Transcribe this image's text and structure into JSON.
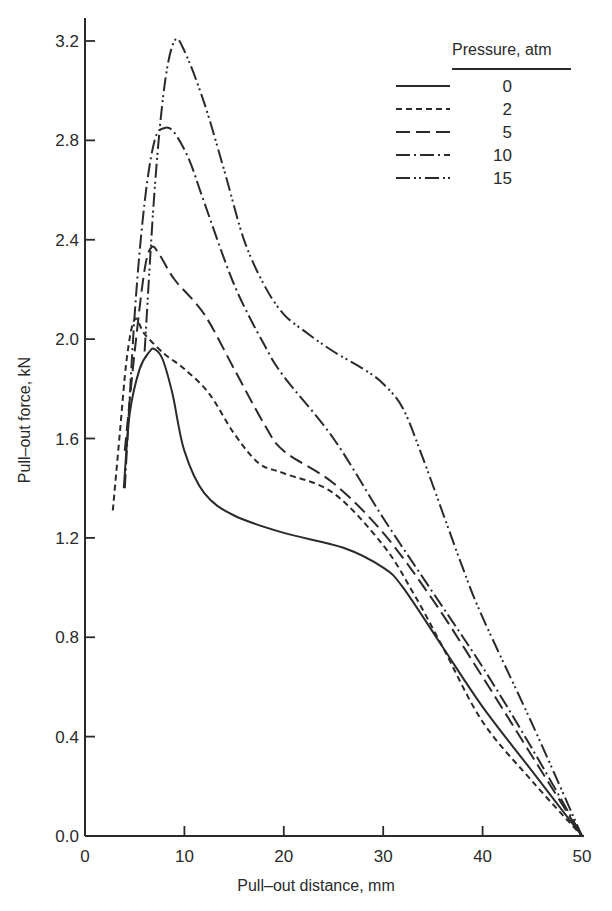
{
  "chart_data": {
    "type": "line",
    "title": "",
    "xlabel": "Pull–out distance, mm",
    "ylabel": "Pull–out force, kN",
    "xlim": [
      0,
      50
    ],
    "ylim": [
      0,
      3.2
    ],
    "x_ticks": [
      0,
      10,
      20,
      30,
      40,
      50
    ],
    "x_tick_labels": [
      "0",
      "10",
      "20",
      "30",
      "40",
      "50"
    ],
    "y_ticks": [
      0.0,
      0.4,
      0.8,
      1.2,
      1.6,
      2.0,
      2.4,
      2.8,
      3.2
    ],
    "y_tick_labels": [
      "0.0",
      "0.4",
      "0.8",
      "1.2",
      "1.6",
      "2.0",
      "2.4",
      "2.8",
      "3.2"
    ],
    "grid": false,
    "legend": {
      "title": "Pressure, atm",
      "position": "upper right"
    },
    "series": [
      {
        "name": "0",
        "line_style": "solid",
        "x": [
          3.9,
          4.5,
          5.5,
          6.5,
          7.0,
          7.8,
          8.8,
          10,
          12,
          15,
          20,
          26,
          30,
          32,
          36,
          40,
          45,
          50
        ],
        "y": [
          1.4,
          1.7,
          1.88,
          1.95,
          1.96,
          1.92,
          1.78,
          1.55,
          1.38,
          1.29,
          1.22,
          1.16,
          1.08,
          1.0,
          0.76,
          0.52,
          0.26,
          0.0
        ]
      },
      {
        "name": "2",
        "line_style": "dashed",
        "x": [
          2.8,
          3.5,
          4.2,
          5.0,
          6.0,
          8.0,
          10,
          12.5,
          15,
          17.5,
          20,
          25,
          30,
          33,
          36,
          40,
          45,
          50
        ],
        "y": [
          1.31,
          1.62,
          1.92,
          2.08,
          2.02,
          1.94,
          1.88,
          1.78,
          1.62,
          1.5,
          1.46,
          1.38,
          1.17,
          0.98,
          0.76,
          0.46,
          0.22,
          0.0
        ]
      },
      {
        "name": "5",
        "line_style": "long-dash",
        "x": [
          4.0,
          5.0,
          6.0,
          6.7,
          7.5,
          9.0,
          12,
          15,
          18,
          20,
          25,
          30,
          35,
          40,
          45,
          50
        ],
        "y": [
          1.55,
          1.95,
          2.28,
          2.37,
          2.34,
          2.24,
          2.1,
          1.88,
          1.66,
          1.55,
          1.42,
          1.22,
          0.95,
          0.64,
          0.32,
          0.0
        ]
      },
      {
        "name": "10",
        "line_style": "dash-dot",
        "x": [
          4.0,
          5.0,
          6.0,
          7.0,
          8.0,
          9.0,
          10.5,
          12,
          15,
          18,
          20,
          25,
          30,
          35,
          40,
          45,
          50
        ],
        "y": [
          1.4,
          2.1,
          2.55,
          2.8,
          2.85,
          2.83,
          2.72,
          2.55,
          2.22,
          1.98,
          1.85,
          1.6,
          1.28,
          0.98,
          0.68,
          0.35,
          0.0
        ]
      },
      {
        "name": "15",
        "line_style": "dash-dot-dot",
        "x": [
          6.0,
          7.0,
          8.0,
          9.0,
          10.0,
          12,
          14,
          16,
          18,
          20,
          22.5,
          25,
          28,
          30,
          32,
          34,
          36,
          38,
          40,
          45,
          50
        ],
        "y": [
          1.95,
          2.6,
          3.02,
          3.2,
          3.16,
          2.95,
          2.68,
          2.4,
          2.22,
          2.1,
          2.02,
          1.95,
          1.88,
          1.82,
          1.72,
          1.52,
          1.3,
          1.08,
          0.88,
          0.45,
          0.0
        ]
      }
    ]
  },
  "plot_area": {
    "x0_px": 85,
    "x1_px": 582,
    "y0_px": 836,
    "y1_px": 41
  },
  "colors": {
    "ink": "#2a2a2a",
    "background": "#ffffff"
  }
}
